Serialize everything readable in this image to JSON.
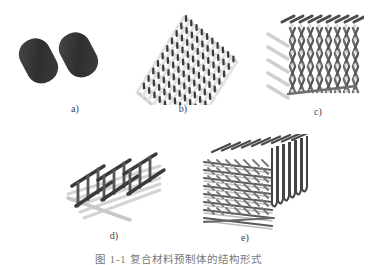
{
  "figure": {
    "panels": [
      {
        "id": "a",
        "label": "a)",
        "description": "two dark capsule-shaped fiber cross-sections"
      },
      {
        "id": "b",
        "label": "b)",
        "description": "2D woven lattice"
      },
      {
        "id": "c",
        "label": "c)",
        "description": "3D woven block lattice"
      },
      {
        "id": "d",
        "label": "d)",
        "description": "orthogonal rod grid frame"
      },
      {
        "id": "e",
        "label": "e)",
        "description": "dense 3D braided block"
      }
    ],
    "caption": "图 1-1  复合材料预制体的结构形式"
  },
  "colors": {
    "dark_rod": "#3a3a3a",
    "light_rod": "#cfcfcf",
    "mid_rod": "#6e6e6e",
    "background": "#ffffff"
  }
}
